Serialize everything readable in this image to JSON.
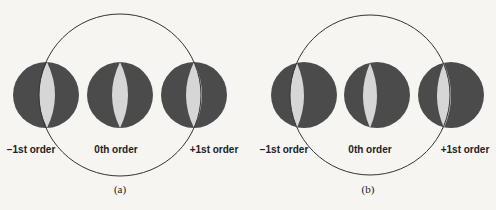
{
  "figure": {
    "background": "#f6f5f2",
    "colors": {
      "order_disc": "#4b4b4b",
      "overlap_lens": "#d6d6d6",
      "pupil_outline": "#333333",
      "text": "#222222"
    },
    "panels": [
      {
        "id": "a",
        "caption": "(a)",
        "caption_pos": {
          "x": 120,
          "y": 193
        },
        "pupil": {
          "cx": 120,
          "cy": 95,
          "r": 81
        },
        "orders": [
          {
            "label": "−1st order",
            "cx": 46,
            "cy": 95,
            "r": 33,
            "label_x": 31,
            "label_y": 153
          },
          {
            "label": "0th order",
            "cx": 120,
            "cy": 95,
            "r": 33,
            "label_x": 116,
            "label_y": 153
          },
          {
            "label": "+1st order",
            "cx": 194,
            "cy": 95,
            "r": 33,
            "label_x": 214,
            "label_y": 153
          }
        ],
        "lenses": [
          {
            "cx": 47,
            "top": 62,
            "bottom": 128,
            "half_width": 8
          },
          {
            "cx": 120,
            "top": 62,
            "bottom": 128,
            "half_width": 8
          },
          {
            "cx": 194,
            "top": 62,
            "bottom": 128,
            "half_width": 8
          }
        ]
      },
      {
        "id": "b",
        "caption": "(b)",
        "caption_pos": {
          "x": 368,
          "y": 193
        },
        "pupil": {
          "cx": 370,
          "cy": 95,
          "r": 80
        },
        "orders": [
          {
            "label": "−1st order",
            "cx": 304,
            "cy": 95,
            "r": 33,
            "label_x": 284,
            "label_y": 153
          },
          {
            "label": "0th order",
            "cx": 377,
            "cy": 95,
            "r": 33,
            "label_x": 370,
            "label_y": 153
          },
          {
            "label": "+1st order",
            "cx": 451,
            "cy": 95,
            "r": 33,
            "label_x": 465,
            "label_y": 153
          }
        ],
        "lenses": [
          {
            "cx": 297,
            "top": 63,
            "bottom": 128,
            "half_width": 7
          },
          {
            "cx": 370,
            "top": 63,
            "bottom": 128,
            "half_width": 7
          },
          {
            "cx": 444,
            "top": 63,
            "bottom": 128,
            "half_width": 7
          }
        ]
      }
    ]
  }
}
